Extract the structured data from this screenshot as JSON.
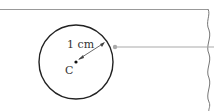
{
  "diagram": {
    "radius_label": "1 cm",
    "center_label": "C",
    "colors": {
      "circle": "#222222",
      "pointer": "#999999",
      "edge": "#888888"
    }
  }
}
